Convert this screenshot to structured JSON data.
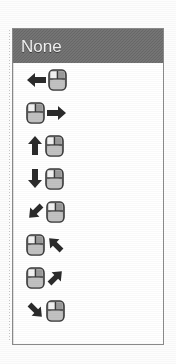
{
  "widget": {
    "type": "listbox",
    "name": "mouse-gesture-list",
    "selected_index": 0,
    "colors": {
      "selection_background": "#6e6e6e",
      "selection_text": "#f2f2f2",
      "panel_background": "#ffffff",
      "panel_border": "#8a8a8a",
      "glyph_dark": "#2b2b2b",
      "mouse_body": "#b5b5b5",
      "mouse_button_light": "#f2f2f2",
      "mouse_outline": "#3a3a3a"
    }
  },
  "items": [
    {
      "index": 0,
      "label": "None",
      "kind": "text",
      "selected": true,
      "icon_name": "none-option"
    },
    {
      "index": 1,
      "label": "",
      "kind": "icon",
      "selected": false,
      "icon_name": "arrow-left-then-mouse-icon",
      "direction": "left",
      "arrow_side": "before"
    },
    {
      "index": 2,
      "label": "",
      "kind": "icon",
      "selected": false,
      "icon_name": "mouse-then-arrow-right-icon",
      "direction": "right",
      "arrow_side": "after"
    },
    {
      "index": 3,
      "label": "",
      "kind": "icon",
      "selected": false,
      "icon_name": "arrow-up-then-mouse-icon",
      "direction": "up",
      "arrow_side": "before"
    },
    {
      "index": 4,
      "label": "",
      "kind": "icon",
      "selected": false,
      "icon_name": "arrow-down-then-mouse-icon",
      "direction": "down",
      "arrow_side": "before"
    },
    {
      "index": 5,
      "label": "",
      "kind": "icon",
      "selected": false,
      "icon_name": "arrow-up-left-then-mouse-icon",
      "direction": "up-left",
      "arrow_side": "before"
    },
    {
      "index": 6,
      "label": "",
      "kind": "icon",
      "selected": false,
      "icon_name": "mouse-then-arrow-up-right-icon",
      "direction": "up-right",
      "arrow_side": "after"
    },
    {
      "index": 7,
      "label": "",
      "kind": "icon",
      "selected": false,
      "icon_name": "mouse-then-arrow-down-right-icon",
      "direction": "down-right",
      "arrow_side": "after"
    },
    {
      "index": 8,
      "label": "",
      "kind": "icon",
      "selected": false,
      "icon_name": "arrow-down-left-then-mouse-icon",
      "direction": "down-left",
      "arrow_side": "before"
    }
  ]
}
